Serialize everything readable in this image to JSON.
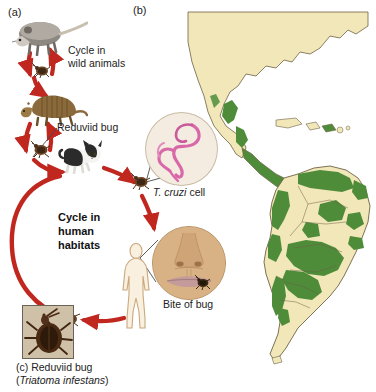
{
  "figure": {
    "panels": [
      {
        "tag": "(a)",
        "name": "transmission-cycle"
      },
      {
        "tag": "(b)",
        "name": "distribution-map"
      },
      {
        "tag": "(c)",
        "name": "reduviid-bug-photo"
      }
    ]
  },
  "panel_a": {
    "tag": "(a)",
    "wild_cycle_label": "Cycle in\nwild animals",
    "wild_cycle_line1": "Cycle in",
    "wild_cycle_line2": "wild animals",
    "reduviid_label": "Reduviid bug",
    "human_cycle_line1": "Cycle in",
    "human_cycle_line2": "human",
    "human_cycle_line3": "habitats",
    "organisms": [
      {
        "name": "opossum",
        "label": "Opossum"
      },
      {
        "name": "armadillo",
        "label": "Armadillo"
      },
      {
        "name": "cat",
        "label": "Domestic cat"
      },
      {
        "name": "human",
        "label": "Human"
      },
      {
        "name": "reduviid-bug",
        "label": "Reduviid bug"
      }
    ]
  },
  "panel_b": {
    "tag": "(b)",
    "map_name": "americas-distribution-map",
    "land_color": "#f2e7b8",
    "endemic_color": "#4e8c3a",
    "outline_color": "#6d6244",
    "regions": [
      "North America",
      "Central America",
      "Caribbean",
      "South America"
    ]
  },
  "insets": {
    "tcruzi": {
      "caption_italic": "T. cruzi",
      "caption_rest": " cell",
      "parasite_color": "#d968a8",
      "background_color": "#f4ece0"
    },
    "bite": {
      "caption": "Bite of bug",
      "skin_color": "#d8b184",
      "lip_color": "#c49a9a"
    }
  },
  "panel_c": {
    "tag": "(c)",
    "caption_line1": "(c) Reduviid bug",
    "caption_line2_italic": "Triatoma infestans",
    "caption_line2_open": "(",
    "caption_line2_close": ")",
    "common_name": "Reduviid bug",
    "species_name": "Triatoma infestans"
  },
  "colors": {
    "arrow_red": "#c0271f",
    "leader_gray": "#4a4a4a",
    "text": "#1a1a1a"
  }
}
